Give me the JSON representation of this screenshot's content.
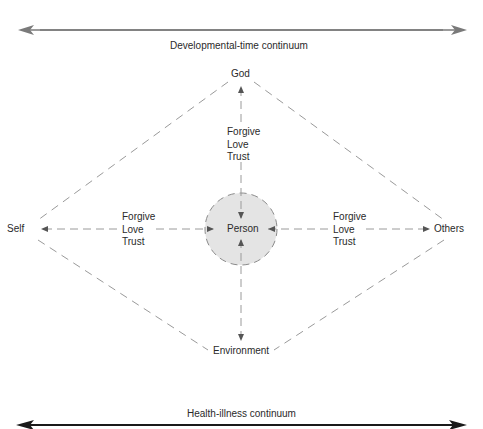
{
  "diagram": {
    "top_continuum": {
      "label": "Developmental-time continuum",
      "color": "#7a7a7a"
    },
    "bottom_continuum": {
      "label": "Health-illness continuum",
      "color": "#1a1a1a"
    },
    "nodes": {
      "top": "God",
      "left": "Self",
      "right": "Others",
      "bottom": "Environment",
      "center": "Person"
    },
    "relations": {
      "top": [
        "Forgive",
        "Love",
        "Trust"
      ],
      "left": [
        "Forgive",
        "Love",
        "Trust"
      ],
      "right": [
        "Forgive",
        "Love",
        "Trust"
      ]
    },
    "colors": {
      "dash": "#9a9a9a",
      "center_fill": "#e4e4e4",
      "text": "#2a2a2a"
    }
  }
}
